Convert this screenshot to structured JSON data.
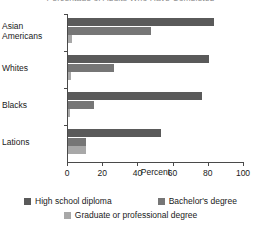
{
  "chart_data": {
    "type": "bar",
    "orientation": "horizontal",
    "title": "Percentage of Adults Who Have Completed",
    "categories": [
      "Asian Americans",
      "Whites",
      "Blacks",
      "Lations"
    ],
    "series": [
      {
        "name": "High school diploma",
        "color": "#5a5a5a",
        "values": [
          83,
          80,
          76,
          53
        ]
      },
      {
        "name": "Bachelor's degree",
        "color": "#767676",
        "values": [
          47,
          26,
          15,
          10
        ]
      },
      {
        "name": "Graduate or professional degree",
        "color": "#a8a8a8",
        "values": [
          2,
          1.5,
          1,
          10
        ]
      }
    ],
    "xlabel": "Percent",
    "ylabel": "",
    "xlim": [
      0,
      100
    ],
    "xticks": [
      0,
      20,
      40,
      60,
      80,
      100
    ],
    "grid": false,
    "legend_position": "bottom"
  }
}
